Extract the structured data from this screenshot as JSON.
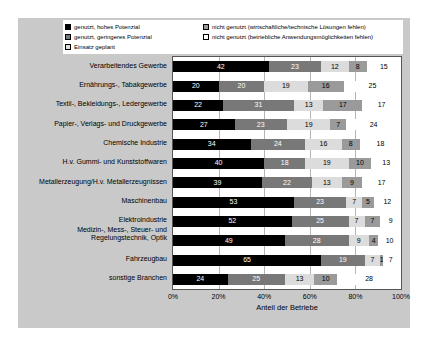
{
  "chart_data": {
    "type": "bar",
    "orientation": "horizontal",
    "stacked": true,
    "stack_total": 100,
    "title": "",
    "xlabel": "Anteil der Betriebe",
    "ylabel": "",
    "xlim": [
      0,
      100
    ],
    "xticks": [
      "0%",
      "20%",
      "40%",
      "60%",
      "80%",
      "100%"
    ],
    "xtick_values": [
      0,
      20,
      40,
      60,
      80,
      100
    ],
    "grid": true,
    "legend_position": "top",
    "legend": [
      {
        "label": "genutzt, hohes Potenzial",
        "color": "#000000"
      },
      {
        "label": "genutzt, geringeres Potenzial",
        "color": "#787878"
      },
      {
        "label": "Einsatz geplant",
        "color": "#dcdcdc"
      },
      {
        "label": "nicht genutzt (wirtschaftliche/technische Lösungen fehlen)",
        "color": "#9a9a9a"
      },
      {
        "label": "nicht genutzt (betriebliche Anwendungsmöglichkeiten fehlen)",
        "color": "#ffffff"
      }
    ],
    "categories": [
      "Verarbeitendes Gewerbe",
      "Ernährungs-, Tabakgewerbe",
      "Textil-, Bekleidungs-, Ledergewerbe",
      "Papier-, Verlags- und Druckgewerbe",
      "Chemische Industrie",
      "H.v. Gummi- und Kunststoffwaren",
      "Metallerzeugung/H.v. Metallerzeugnissen",
      "Maschinenbau",
      "Elektroindustrie",
      "Medizin-, Mess-, Steuer- und Regelungstechnik, Optik",
      "Fahrzeugbau",
      "sonstige Branchen"
    ],
    "series": [
      {
        "name": "genutzt, hohes Potenzial",
        "values": [
          42,
          20,
          22,
          27,
          34,
          40,
          39,
          53,
          52,
          49,
          65,
          24
        ]
      },
      {
        "name": "genutzt, geringeres Potenzial",
        "values": [
          23,
          20,
          31,
          23,
          24,
          18,
          22,
          23,
          25,
          28,
          19,
          25
        ]
      },
      {
        "name": "Einsatz geplant",
        "values": [
          12,
          19,
          13,
          19,
          16,
          19,
          13,
          7,
          7,
          9,
          7,
          13
        ]
      },
      {
        "name": "nicht genutzt (wirtschaftliche/technische Lösungen fehlen)",
        "values": [
          8,
          16,
          17,
          7,
          8,
          10,
          9,
          5,
          7,
          4,
          1,
          10
        ]
      },
      {
        "name": "nicht genutzt (betriebliche Anwendungsmöglichkeiten fehlen)",
        "values": [
          15,
          25,
          17,
          24,
          18,
          13,
          17,
          12,
          9,
          10,
          7,
          28
        ]
      }
    ]
  }
}
